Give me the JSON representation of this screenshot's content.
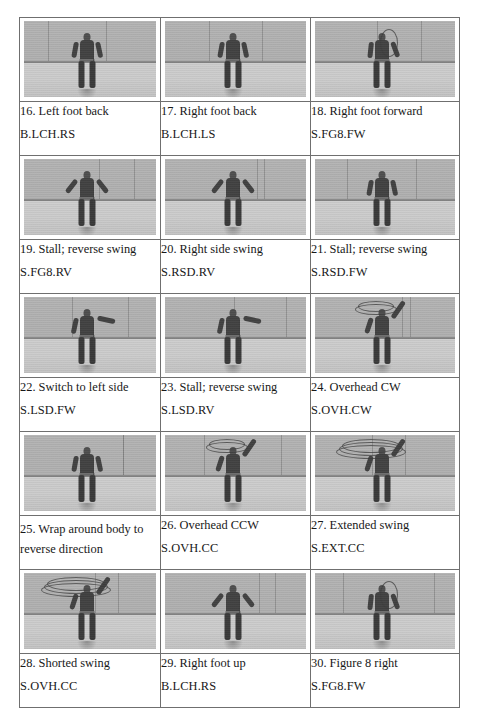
{
  "document": {
    "type": "figure-grid-table",
    "columns": 3,
    "photo_rows": 5,
    "total_figures": 15
  },
  "table": {
    "rows": [
      {
        "cells": [
          {
            "number": "16.",
            "title": "16. Left foot back",
            "code": "B.LCH.RS",
            "photo_alt": "person standing side-on in gym holding rope dart, left foot back",
            "pose": "side-stance"
          },
          {
            "number": "17.",
            "title": "17. Right foot back",
            "code": "B.LCH.LS",
            "photo_alt": "person standing in gym holding rope dart, right foot back",
            "pose": "side-stance"
          },
          {
            "number": "18.",
            "title": "18. Right foot forward",
            "code": "S.FG8.FW",
            "photo_alt": "person in gym swinging rope overhead, right foot forward",
            "pose": "rope-up"
          }
        ]
      },
      {
        "cells": [
          {
            "number": "19.",
            "title": "19. Stall; reverse swing",
            "code": "S.FG8.RV",
            "photo_alt": "person facing camera arms out, rope stalled",
            "pose": "arms-out"
          },
          {
            "number": "20.",
            "title": "20. Right side swing",
            "code": "S.RSD.RV",
            "photo_alt": "person facing camera swinging rope on right side",
            "pose": "arms-out"
          },
          {
            "number": "21.",
            "title": "21. Stall; reverse swing",
            "code": "S.RSD.FW",
            "photo_alt": "person with rope held at right side",
            "pose": "side-stance"
          }
        ]
      },
      {
        "cells": [
          {
            "number": "22.",
            "title": "22. Switch to left side",
            "code": "S.LSD.FW",
            "photo_alt": "person stepping, rope switching to left side",
            "pose": "reach-right"
          },
          {
            "number": "23.",
            "title": "23. Stall; reverse swing",
            "code": "S.LSD.RV",
            "photo_alt": "person with arm extended right, rope stalled",
            "pose": "reach-right"
          },
          {
            "number": "24.",
            "title": "24. Overhead CW",
            "code": "S.OVH.CW",
            "photo_alt": "person spinning rope overhead clockwise, arm raised",
            "pose": "overhead"
          }
        ]
      },
      {
        "cells": [
          {
            "number": "25.",
            "title": "25. Wrap around body to reverse direction",
            "code": "",
            "photo_alt": "person wrapping rope around body to reverse direction",
            "pose": "side-stance",
            "title_wraps": true
          },
          {
            "number": "26.",
            "title": "26. Overhead CCW",
            "code": "S.OVH.CC",
            "photo_alt": "person spinning rope overhead counter-clockwise, arm raised",
            "pose": "overhead"
          },
          {
            "number": "27.",
            "title": "27. Extended swing",
            "code": "S.EXT.CC",
            "photo_alt": "person with large extended overhead rope loop",
            "pose": "overhead-wide"
          }
        ]
      },
      {
        "cells": [
          {
            "number": "28.",
            "title": "28. Shorted swing",
            "code": "S.OVH.CC",
            "photo_alt": "person with shortened overhead rope loop",
            "pose": "overhead-wide"
          },
          {
            "number": "29.",
            "title": "29. Right foot up",
            "code": "B.LCH.RS",
            "photo_alt": "person lifting right foot, arm extended",
            "pose": "arms-out"
          },
          {
            "number": "30.",
            "title": "30. Figure 8 right",
            "code": "S.FG8.FW",
            "photo_alt": "person doing figure 8 swing to the right",
            "pose": "rope-up"
          }
        ]
      }
    ]
  },
  "colors": {
    "page_background": "#ffffff",
    "border": "#6f6f6f",
    "text": "#181818",
    "photo_wall": "#b7b5b1",
    "photo_floor": "#cfcdc9",
    "floor_line": "#3d3b39",
    "figure": "#403d3a"
  }
}
